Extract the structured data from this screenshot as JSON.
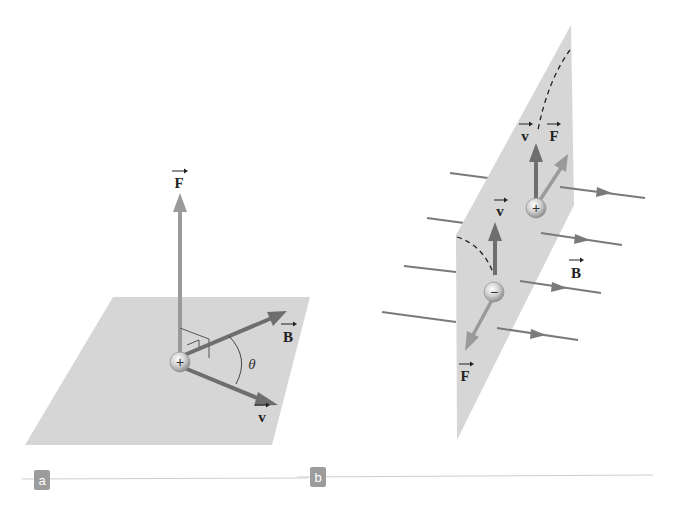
{
  "panels": [
    {
      "id": "a",
      "tag": "a",
      "labels": {
        "force": "F",
        "field": "B",
        "velocity": "v",
        "angle": "θ"
      },
      "charge": "+",
      "description": "Positive charge moving with velocity v at angle θ to field B in a plane; force F perpendicular to the plane"
    },
    {
      "id": "b",
      "tag": "b",
      "labels": {
        "velocity_pos": "v",
        "force_pos": "F",
        "velocity_neg": "v",
        "force_neg": "F",
        "field": "B"
      },
      "charge_pos": "+",
      "charge_neg": "−",
      "description": "Opposite charges moving in a vertical plane in a uniform field B deflect in opposite directions along dashed paths"
    }
  ],
  "colors": {
    "plane": "#d6d6d6",
    "vector_dark": "#6e6e6e",
    "vector_light": "#9a9a9a",
    "field_line": "#7a7a7a",
    "tag_bg": "#9c9c9c",
    "rule": "#cfcfcf"
  }
}
